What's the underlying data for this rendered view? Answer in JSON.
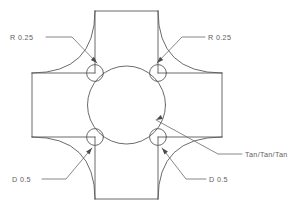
{
  "drawing": {
    "title": "Cross Profile Sketch",
    "background_color": "#ffffff",
    "line_color": "#5a5a5a",
    "text_color": "#5e5e5e",
    "canvas": {
      "width": 302,
      "height": 210
    }
  },
  "annotations": {
    "radius_top_left": {
      "label": "R 0.25",
      "text_x": 10,
      "text_y": 40,
      "leader_points": "46,37 72,37 97,63",
      "arrow_x": 97,
      "arrow_y": 63,
      "arrow_angle": 45
    },
    "radius_top_right": {
      "label": "R 0.25",
      "text_x": 208,
      "text_y": 40,
      "leader_points": "205,37 182,37 157,63",
      "arrow_x": 157,
      "arrow_y": 63,
      "arrow_angle": 135
    },
    "diameter_bottom_left": {
      "label": "D 0.5",
      "text_x": 12,
      "text_y": 182,
      "leader_points": "42,179 66,179 92,148",
      "arrow_x": 92,
      "arrow_y": 148,
      "arrow_angle": -50
    },
    "diameter_bottom_right": {
      "label": "D 0.5",
      "text_x": 209,
      "text_y": 182,
      "leader_points": "206,179 186,179 162,148",
      "arrow_x": 162,
      "arrow_y": 148,
      "arrow_angle": -130
    },
    "tangency_note": {
      "label": "Tan/Tan/Tan",
      "text_x": 245,
      "text_y": 157,
      "leader_points": "242,154 218,154 156,120",
      "arrow_x": 156,
      "arrow_y": 120,
      "arrow_angle": 152
    }
  },
  "geometry": {
    "description": "Plus/cross outline with concave fillets, central circle tangent to four corner circles",
    "cross_outline_path": "M 95 11 L 158 11 L 158 32 Q 158 73 199 73 L 222 73 L 222 137 L 199 137 Q 158 137 158 178 L 158 199 L 95 199 L 95 178 Q 95 137 54 137 L 32 137 L 32 73 L 54 73 Q 95 73 95 32 Z",
    "inner_rect": {
      "x": 32,
      "y": 73,
      "width": 190,
      "height": 64
    },
    "vertical_band_left_x": 95,
    "vertical_band_right_x": 158,
    "center_circle": {
      "cx": 126.5,
      "cy": 105,
      "r": 39
    },
    "corner_circles": [
      {
        "name": "circle-top-left",
        "cx": 95,
        "cy": 73,
        "r": 8.4
      },
      {
        "name": "circle-top-right",
        "cx": 158,
        "cy": 73,
        "r": 8.4
      },
      {
        "name": "circle-bottom-left",
        "cx": 95,
        "cy": 137,
        "r": 8.4
      },
      {
        "name": "circle-bottom-right",
        "cx": 158,
        "cy": 137,
        "r": 8.4
      }
    ]
  }
}
